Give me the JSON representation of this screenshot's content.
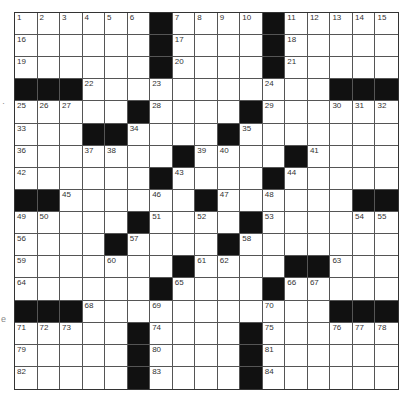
{
  "puzzle": {
    "type": "crossword",
    "rows": 17,
    "cols": 17,
    "colors": {
      "block": "#111111",
      "cell": "#ffffff",
      "grid_line": "#555555",
      "number": "#333333"
    },
    "grid": [
      [
        "1",
        "2",
        "3",
        "4",
        "5",
        "6",
        "#",
        "7",
        "8",
        "9",
        "10",
        "#",
        "11",
        "12",
        "13",
        "14",
        "15"
      ],
      [
        "16",
        "",
        "",
        "",
        "",
        "",
        "#",
        "17",
        "",
        "",
        "",
        "#",
        "18",
        "",
        "",
        "",
        ""
      ],
      [
        "19",
        "",
        "",
        "",
        "",
        "",
        "#",
        "20",
        "",
        "",
        "",
        "#",
        "21",
        "",
        "",
        "",
        ""
      ],
      [
        "#",
        "#",
        "#",
        "22",
        "",
        "",
        "23",
        "",
        "",
        "",
        "",
        "24",
        "",
        "",
        "#",
        "#",
        "#"
      ],
      [
        "25",
        "26",
        "27",
        "",
        "",
        "#",
        "28",
        "",
        "",
        "",
        "#",
        "29",
        "",
        "",
        "30",
        "31",
        "32"
      ],
      [
        "33",
        "",
        "",
        "#",
        "#",
        "34",
        "",
        "",
        "",
        "#",
        "35",
        "",
        "",
        "",
        "",
        "",
        ""
      ],
      [
        "36",
        "",
        "",
        "37",
        "38",
        "",
        "",
        "#",
        "39",
        "40",
        "",
        "",
        "#",
        "41",
        "",
        "",
        ""
      ],
      [
        "42",
        "",
        "",
        "",
        "",
        "",
        "#",
        "43",
        "",
        "",
        "",
        "#",
        "44",
        "",
        "",
        "",
        ""
      ],
      [
        "#",
        "#",
        "45",
        "",
        "",
        "",
        "46",
        "",
        "#",
        "47",
        "",
        "48",
        "",
        "",
        "",
        "#",
        "#"
      ],
      [
        "49",
        "50",
        "",
        "",
        "",
        "#",
        "51",
        "",
        "52",
        "",
        "#",
        "53",
        "",
        "",
        "",
        "54",
        "55"
      ],
      [
        "56",
        "",
        "",
        "",
        "#",
        "57",
        "",
        "",
        "",
        "#",
        "58",
        "",
        "",
        "",
        "",
        "",
        ""
      ],
      [
        "59",
        "",
        "",
        "",
        "60",
        "",
        "",
        "#",
        "61",
        "62",
        "",
        "",
        "#",
        "#",
        "63",
        "",
        ""
      ],
      [
        "64",
        "",
        "",
        "",
        "",
        "",
        "#",
        "65",
        "",
        "",
        "",
        "#",
        "66",
        "67",
        "",
        "",
        ""
      ],
      [
        "#",
        "#",
        "#",
        "68",
        "",
        "",
        "69",
        "",
        "",
        "",
        "",
        "70",
        "",
        "",
        "#",
        "#",
        "#"
      ],
      [
        "71",
        "72",
        "73",
        "",
        "",
        "#",
        "74",
        "",
        "",
        "",
        "#",
        "75",
        "",
        "",
        "76",
        "77",
        "78"
      ],
      [
        "79",
        "",
        "",
        "",
        "",
        "#",
        "80",
        "",
        "",
        "",
        "#",
        "81",
        "",
        "",
        "",
        "",
        ""
      ],
      [
        "82",
        "",
        "",
        "",
        "",
        "#",
        "83",
        "",
        "",
        "",
        "#",
        "84",
        "",
        "",
        "",
        "",
        ""
      ]
    ]
  },
  "margin_marks": [
    {
      "text": "·",
      "x": 2,
      "y": 98
    },
    {
      "text": "e",
      "x": 1,
      "y": 314
    }
  ]
}
